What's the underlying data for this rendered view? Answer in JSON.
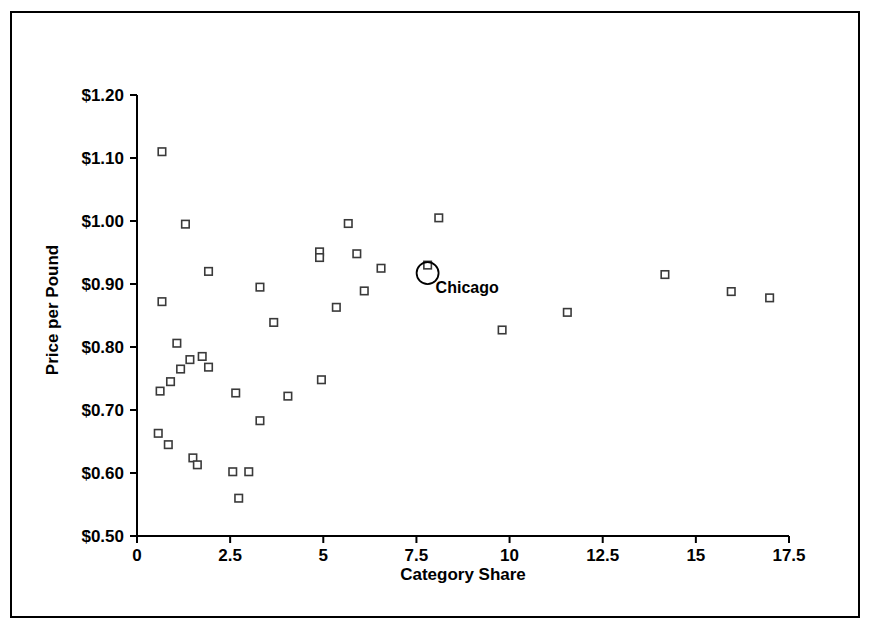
{
  "chart_data": {
    "type": "scatter",
    "title": "",
    "xlabel": "Category Share",
    "ylabel": "Price per Pound",
    "xlim": [
      0,
      17.5
    ],
    "ylim": [
      0.5,
      1.2
    ],
    "grid": false,
    "legend": null,
    "xticks": [
      "0",
      "2.5",
      "5",
      "7.5",
      "10",
      "12.5",
      "15",
      "17.5"
    ],
    "xtick_values": [
      0,
      2.5,
      5,
      7.5,
      10,
      12.5,
      15,
      17.5
    ],
    "yticks": [
      "$0.50",
      "$0.60",
      "$0.70",
      "$0.80",
      "$0.90",
      "$1.00",
      "$1.10",
      "$1.20"
    ],
    "ytick_values": [
      0.5,
      0.6,
      0.7,
      0.8,
      0.9,
      1.0,
      1.1,
      1.2
    ],
    "marker_style": "open-square",
    "annotations": [
      {
        "label": "Chicago",
        "x": 7.8,
        "y": 0.93,
        "highlight": "circle"
      }
    ],
    "points": [
      {
        "x": 0.67,
        "y": 1.11
      },
      {
        "x": 1.3,
        "y": 0.995
      },
      {
        "x": 1.92,
        "y": 0.92
      },
      {
        "x": 0.67,
        "y": 0.872
      },
      {
        "x": 3.3,
        "y": 0.895
      },
      {
        "x": 1.07,
        "y": 0.806
      },
      {
        "x": 1.42,
        "y": 0.78
      },
      {
        "x": 1.75,
        "y": 0.785
      },
      {
        "x": 1.17,
        "y": 0.765
      },
      {
        "x": 1.92,
        "y": 0.768
      },
      {
        "x": 0.62,
        "y": 0.73
      },
      {
        "x": 0.9,
        "y": 0.745
      },
      {
        "x": 2.65,
        "y": 0.727
      },
      {
        "x": 3.3,
        "y": 0.683
      },
      {
        "x": 3.67,
        "y": 0.839
      },
      {
        "x": 4.05,
        "y": 0.722
      },
      {
        "x": 4.9,
        "y": 0.951
      },
      {
        "x": 4.9,
        "y": 0.942
      },
      {
        "x": 4.95,
        "y": 0.748
      },
      {
        "x": 5.35,
        "y": 0.863
      },
      {
        "x": 5.67,
        "y": 0.996
      },
      {
        "x": 5.9,
        "y": 0.948
      },
      {
        "x": 6.1,
        "y": 0.889
      },
      {
        "x": 6.55,
        "y": 0.925
      },
      {
        "x": 8.1,
        "y": 1.005
      },
      {
        "x": 7.8,
        "y": 0.93
      },
      {
        "x": 9.8,
        "y": 0.827
      },
      {
        "x": 11.55,
        "y": 0.855
      },
      {
        "x": 14.17,
        "y": 0.915
      },
      {
        "x": 15.95,
        "y": 0.888
      },
      {
        "x": 16.98,
        "y": 0.878
      },
      {
        "x": 0.57,
        "y": 0.663
      },
      {
        "x": 0.84,
        "y": 0.645
      },
      {
        "x": 1.5,
        "y": 0.624
      },
      {
        "x": 1.62,
        "y": 0.613
      },
      {
        "x": 2.57,
        "y": 0.602
      },
      {
        "x": 3.0,
        "y": 0.602
      },
      {
        "x": 2.73,
        "y": 0.56
      }
    ]
  },
  "colors": {
    "frame": "#000000",
    "axis": "#000000",
    "marker_stroke": "#3a3a3a",
    "marker_fill": "#ffffff",
    "background": "#ffffff",
    "text": "#000000"
  }
}
